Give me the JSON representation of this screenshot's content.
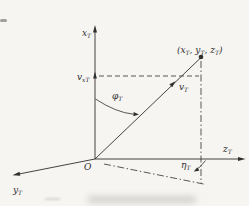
{
  "figure": {
    "background": "#f6f5f2",
    "ink": "#2f2f2f",
    "labels": {
      "x_axis": {
        "main": "x",
        "sub": "T"
      },
      "y_axis": {
        "main": "y",
        "sub": "T"
      },
      "z_axis": {
        "main": "z",
        "sub": "T"
      },
      "origin": "O",
      "point": {
        "p1": "(x",
        "s1": "T",
        "p2": ", y",
        "s2": "T",
        "p3": ", z",
        "s3": "T",
        "p4": ")"
      },
      "velocity_vector": {
        "main": "v",
        "sub": "T"
      },
      "velocity_x_component": {
        "main": "v",
        "sub": "xT"
      },
      "elevation_angle": {
        "main": "φ",
        "sub": "T"
      },
      "azimuth_angle": {
        "main": "η",
        "sub": "T"
      }
    }
  }
}
